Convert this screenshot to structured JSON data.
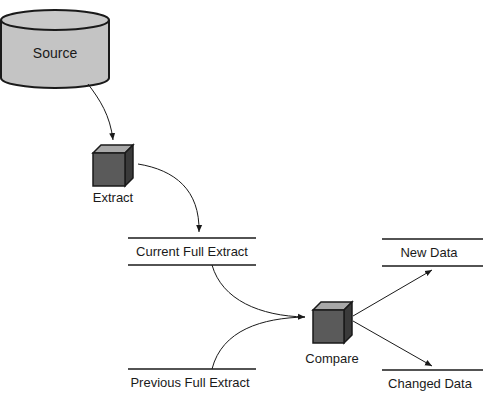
{
  "diagram": {
    "title": "",
    "nodes": {
      "source": {
        "label": "Source",
        "shape": "database-cylinder-icon"
      },
      "extract": {
        "label": "Extract",
        "shape": "cube-process-icon"
      },
      "current_full_extract": {
        "label": "Current Full Extract",
        "shape": "data-store"
      },
      "previous_full_extract": {
        "label": "Previous Full Extract",
        "shape": "data-store"
      },
      "compare": {
        "label": "Compare",
        "shape": "cube-process-icon"
      },
      "new_data": {
        "label": "New Data",
        "shape": "data-store"
      },
      "changed_data": {
        "label": "Changed Data",
        "shape": "data-store"
      }
    },
    "edges": [
      {
        "from": "Source",
        "to": "Extract"
      },
      {
        "from": "Extract",
        "to": "Current Full Extract"
      },
      {
        "from": "Current Full Extract",
        "to": "Compare"
      },
      {
        "from": "Previous Full Extract",
        "to": "Compare"
      },
      {
        "from": "Compare",
        "to": "New Data"
      },
      {
        "from": "Compare",
        "to": "Changed Data"
      }
    ],
    "colors": {
      "cylinder_fill": "#c4c4c4",
      "cube_front": "#5a5a5a",
      "cube_top": "#a8a8a8",
      "cube_side": "#3a3a3a",
      "stroke": "#1a1a1a"
    }
  }
}
